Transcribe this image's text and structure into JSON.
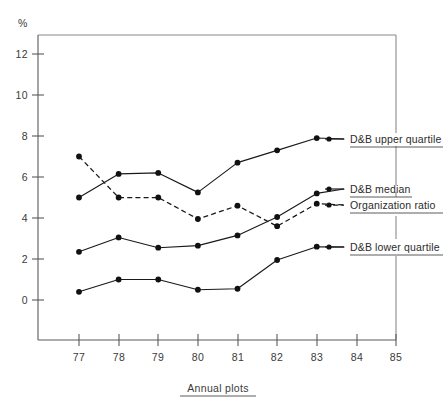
{
  "chart_data": {
    "type": "line",
    "title": "",
    "subtitle": "",
    "xlabel": "Annual plots",
    "ylabel": "%",
    "x": [
      77,
      78,
      79,
      80,
      81,
      82,
      83
    ],
    "x_tick_labels": [
      "77",
      "78",
      "79",
      "80",
      "81",
      "82",
      "83",
      "84",
      "85"
    ],
    "x_tick_values": [
      77,
      78,
      79,
      80,
      81,
      82,
      83,
      84,
      85
    ],
    "xlim": [
      76.4,
      85
    ],
    "ylim": [
      -1.4,
      12.6
    ],
    "y_tick_labels": [
      "0",
      "2",
      "4",
      "6",
      "8",
      "10",
      "12"
    ],
    "y_tick_values": [
      0,
      2,
      4,
      6,
      8,
      10,
      12
    ],
    "grid": false,
    "legend_position": "right",
    "series": [
      {
        "name": "D&B upper quartile",
        "style": "solid",
        "marker": "filled-circle",
        "values": [
          5.0,
          6.15,
          6.2,
          5.25,
          6.7,
          7.3,
          7.9
        ]
      },
      {
        "name": "Organization ratio",
        "style": "dashed",
        "marker": "filled-circle",
        "values": [
          7.0,
          5.0,
          5.0,
          3.95,
          4.6,
          3.6,
          4.7
        ]
      },
      {
        "name": "D&B median",
        "style": "solid",
        "marker": "filled-circle",
        "values": [
          2.35,
          3.05,
          2.55,
          2.65,
          3.15,
          4.05,
          5.2
        ]
      },
      {
        "name": "D&B lower quartile",
        "style": "solid",
        "marker": "filled-circle",
        "values": [
          0.4,
          1.0,
          1.0,
          0.5,
          0.55,
          1.95,
          2.6
        ]
      }
    ]
  },
  "axes": {
    "y_unit_label": "%",
    "x_axis_title": "Annual plots"
  },
  "legend": {
    "entries": [
      {
        "label": "D&B upper quartile",
        "style": "solid"
      },
      {
        "label": "D&B median",
        "style": "solid"
      },
      {
        "label": "Organization ratio",
        "style": "dashed"
      },
      {
        "label": "D&B lower quartile",
        "style": "solid"
      }
    ]
  },
  "y_ticks": [
    {
      "label": "12"
    },
    {
      "label": "10"
    },
    {
      "label": "8"
    },
    {
      "label": "6"
    },
    {
      "label": "4"
    },
    {
      "label": "2"
    },
    {
      "label": "0"
    }
  ],
  "x_ticks": [
    {
      "label": "77"
    },
    {
      "label": "78"
    },
    {
      "label": "79"
    },
    {
      "label": "80"
    },
    {
      "label": "81"
    },
    {
      "label": "82"
    },
    {
      "label": "83"
    },
    {
      "label": "84"
    },
    {
      "label": "85"
    }
  ]
}
